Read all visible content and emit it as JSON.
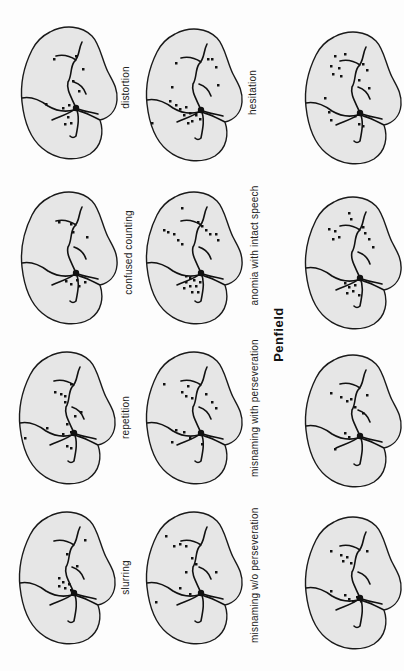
{
  "figure": {
    "caption": "Penfield",
    "panels": [
      {
        "id": "distortion",
        "label": "distortion",
        "column": 1,
        "row": 1
      },
      {
        "id": "confused-counting",
        "label": "confused counting",
        "column": 1,
        "row": 2
      },
      {
        "id": "repetition",
        "label": "repetition",
        "column": 1,
        "row": 3
      },
      {
        "id": "slurring",
        "label": "slurring",
        "column": 1,
        "row": 4
      },
      {
        "id": "hesitation",
        "label": "hesitation",
        "column": 2,
        "row": 1
      },
      {
        "id": "anomia-intact-speech",
        "label": "anomia with intact speech",
        "column": 2,
        "row": 2
      },
      {
        "id": "misnaming-with-perseveration",
        "label": "misnaming with perseveration",
        "column": 2,
        "row": 3
      },
      {
        "id": "misnaming-without-perseveration",
        "label": "misnaming w/o perseveration",
        "column": 2,
        "row": 4
      },
      {
        "id": "unlabeled-1",
        "label": "",
        "column": 3,
        "row": 1
      },
      {
        "id": "unlabeled-2",
        "label": "",
        "column": 3,
        "row": 2
      },
      {
        "id": "unlabeled-3",
        "label": "",
        "column": 3,
        "row": 3
      },
      {
        "id": "unlabeled-4",
        "label": "",
        "column": 3,
        "row": 4
      }
    ]
  },
  "colors": {
    "brain_fill": "#e6e6e6",
    "outline": "#1a1a1a",
    "dots": "#111111",
    "background": "#fdfdfd"
  }
}
